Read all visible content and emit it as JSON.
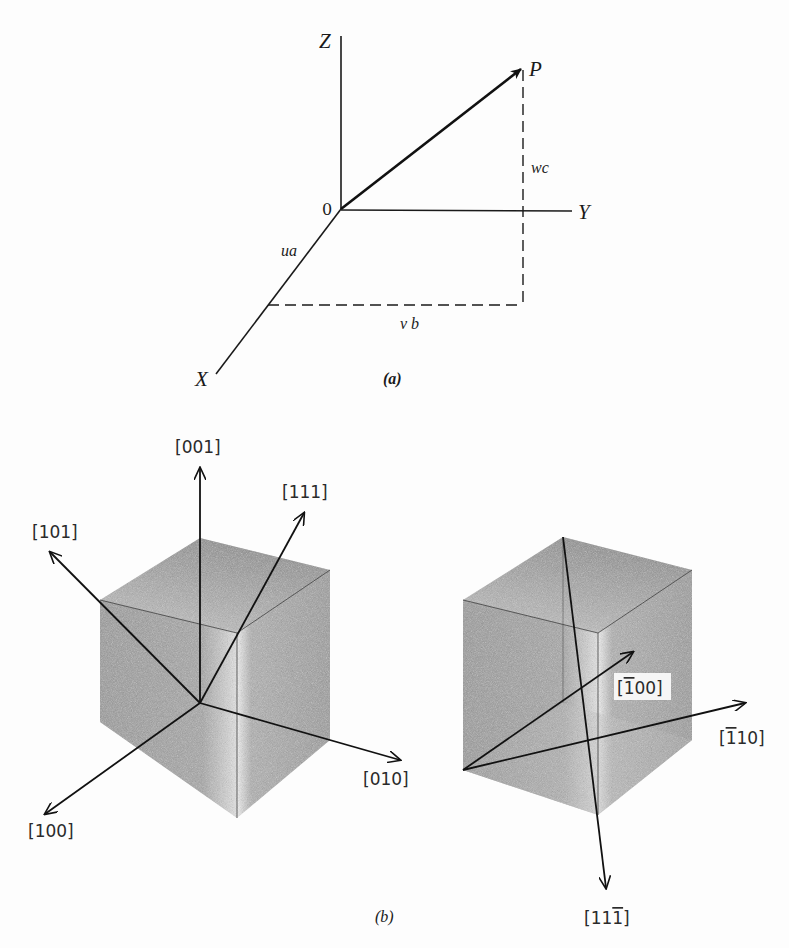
{
  "figure": {
    "part_a": {
      "caption": "(a)",
      "axes": {
        "x": "X",
        "y": "Y",
        "z": "Z",
        "origin": "0"
      },
      "point": "P",
      "components": {
        "x": "ua",
        "y": "v b",
        "z": "wc"
      }
    },
    "part_b": {
      "caption": "(b)",
      "cube_left": {
        "directions": [
          "[001]",
          "[111]",
          "[101]",
          "[010]",
          "[100]"
        ]
      },
      "cube_right": {
        "directions": [
          {
            "label": "[100]",
            "bar_digit_index": 0,
            "display": "[̄100]"
          },
          {
            "label": "[110]",
            "bar_digit_index": 0
          },
          {
            "label": "[111]",
            "bar_digit_index": 2
          }
        ],
        "labels_text": {
          "neg100_open": "[",
          "neg100_barred": "1",
          "neg100_rest": "00]",
          "neg110_open": "[",
          "neg110_barred": "1",
          "neg110_rest": "10]",
          "p11neg1_open": "[11",
          "p11neg1_barred": "1",
          "p11neg1_close": "]"
        }
      }
    },
    "colors": {
      "background": "#fdfdfd",
      "ink": "#1a1a1a",
      "cube_face_dark": "#8a8a8a",
      "cube_face_mid": "#a8a8a8",
      "cube_face_light": "#c8c8c8",
      "cube_highlight": "#f2f2f2"
    }
  }
}
